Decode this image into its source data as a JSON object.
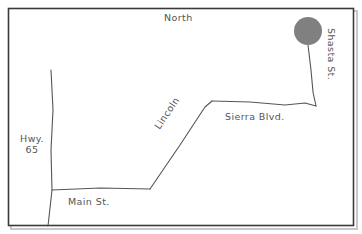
{
  "figure": {
    "type": "hand-drawn-street-map",
    "width": 362,
    "height": 234,
    "background_color": "#ffffff",
    "frame_color": "#3a3a3a",
    "road_color": "#555555",
    "label_color": "#555555",
    "marker_color": "#808080"
  },
  "labels": {
    "north": "North",
    "hwy_line1": "Hwy.",
    "hwy_line2": "65",
    "main_street": "Main St.",
    "lincoln": "Lincoln",
    "sierra_blvd": "Sierra Blvd.",
    "shasta_street": "Shasta St."
  },
  "roads": [
    {
      "name": "Hwy. 65",
      "orientation": "vertical",
      "path": "M 51 70 L 53 110 L 51 150 L 52 190 L 50 208 L 48 226"
    },
    {
      "name": "Main St.",
      "orientation": "horizontal",
      "path": "M 52 190 L 100 188 L 150 189"
    },
    {
      "name": "Lincoln",
      "orientation": "diagonal",
      "path": "M 150 189 L 180 145 L 205 107 L 212 101"
    },
    {
      "name": "Sierra Blvd.",
      "orientation": "horizontal",
      "path": "M 212 101 L 250 102 L 285 105 L 305 103 L 316 106"
    },
    {
      "name": "Shasta St.",
      "orientation": "vertical",
      "path": "M 308 45 L 311 70 L 313 92 L 316 106"
    }
  ],
  "marker": {
    "name": "location-marker",
    "shape": "circle",
    "cx": 308,
    "cy": 31,
    "r": 14,
    "fill": "#808080"
  },
  "frame": {
    "x": 8,
    "y": 8,
    "width": 346,
    "height": 218
  }
}
